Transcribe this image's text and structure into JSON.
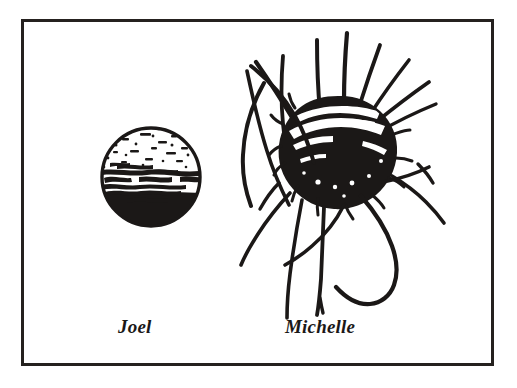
{
  "document": {
    "type": "scanned-line-drawing",
    "background_color": "#ffffff",
    "ink_color": "#1b1817"
  },
  "frame": {
    "name": "figure-border",
    "border_color": "#25211f",
    "border_width_px": 3
  },
  "figures": [
    {
      "id": "joel",
      "label": "Joel",
      "description": "hand-drawn circle, sparse speckles in upper region, horizontal scribbled band across middle, solid black lower half",
      "center_x": 151,
      "center_y": 177,
      "radius": 50,
      "fill_color": "#1b1817"
    },
    {
      "id": "michelle",
      "label": "Michelle",
      "description": "densely scribbled solid black ball with white streaks, surrounded by many long radiating hair-like tendrils and a large curved hook below right",
      "center_x": 338,
      "center_y": 155,
      "radius": 58,
      "fill_color": "#1b1817"
    }
  ],
  "captions": {
    "joel": "Joel",
    "michelle": "Michelle"
  }
}
